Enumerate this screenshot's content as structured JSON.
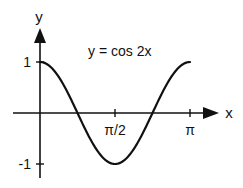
{
  "chart_data": {
    "type": "line",
    "title": "y = cos 2x",
    "function": "cos(2x)",
    "xlabel": "x",
    "ylabel": "y",
    "xlim": [
      0,
      3.1416
    ],
    "ylim": [
      -1,
      1
    ],
    "x_ticks": [
      {
        "value": 1.5708,
        "label": "π/2"
      },
      {
        "value": 3.1416,
        "label": "π"
      }
    ],
    "y_ticks": [
      {
        "value": 1,
        "label": "1"
      },
      {
        "value": -1,
        "label": "-1"
      }
    ],
    "x": [
      0,
      0.3927,
      0.7854,
      1.1781,
      1.5708,
      1.9635,
      2.3562,
      2.7489,
      3.1416
    ],
    "series": [
      {
        "name": "y = cos 2x",
        "values": [
          1,
          0.7071,
          0,
          -0.7071,
          -1,
          -0.7071,
          0,
          0.7071,
          1
        ]
      }
    ],
    "grid": false,
    "legend": "none",
    "annotation": "y = cos 2x",
    "color": "#111111"
  }
}
